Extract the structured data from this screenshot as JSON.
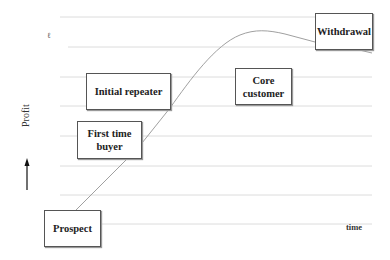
{
  "diagram": {
    "type": "customer lifecycle profit curve",
    "axes": {
      "y_label": "Profit",
      "x_label": "time"
    },
    "stages": [
      {
        "id": "prospect",
        "label": "Prospect"
      },
      {
        "id": "first-time-buyer",
        "label": "First time buyer"
      },
      {
        "id": "initial-repeater",
        "label": "Initial repeater"
      },
      {
        "id": "core-customer",
        "label": "Core customer"
      },
      {
        "id": "withdrawal",
        "label": "Withdrawal"
      }
    ],
    "stray_mark": "ℓ",
    "colors": {
      "gridline": "#dddddd",
      "curve": "#999999",
      "box_border": "#555555",
      "text": "#222222"
    }
  }
}
